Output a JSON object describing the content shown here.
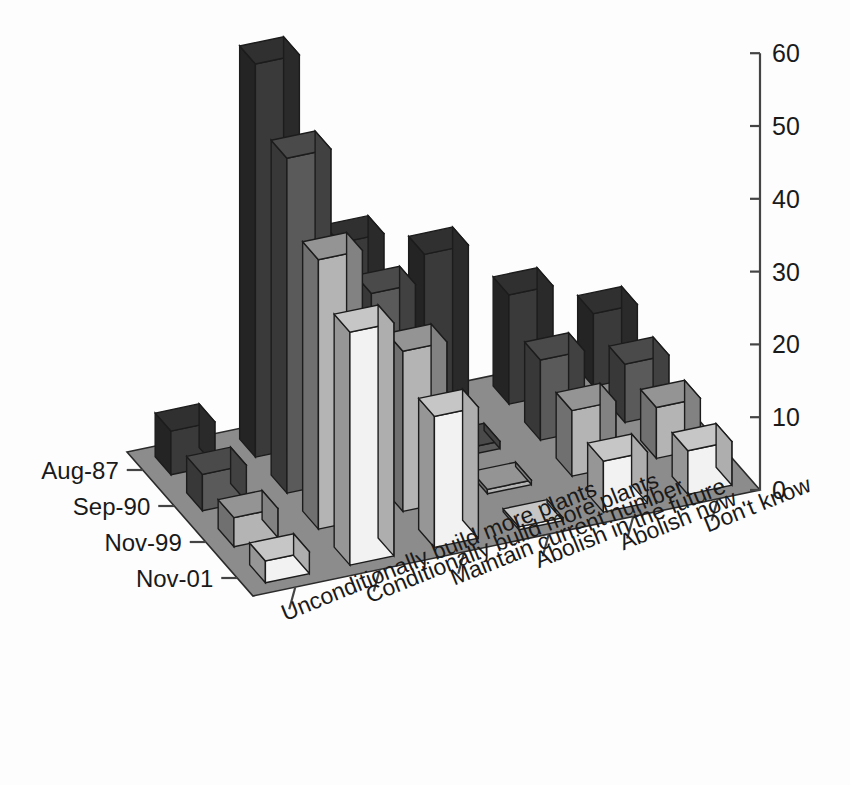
{
  "chart_data": {
    "type": "bar",
    "title": "",
    "subtitle": "",
    "xlabel": "",
    "ylabel": "",
    "zlabel": "",
    "projection": "3d-isometric",
    "grid": false,
    "legend_position": "none",
    "ylim": [
      0,
      60
    ],
    "ytick_labels": [
      "0",
      "10",
      "20",
      "30",
      "40",
      "50",
      "60"
    ],
    "ytick_values": [
      0,
      10,
      20,
      30,
      40,
      50,
      60
    ],
    "categories": [
      "Unconditionally build more plants",
      "Conditionally build more plants",
      "Maintain current number",
      "Abolish in the future",
      "Abolish now",
      "Don't know"
    ],
    "series": [
      {
        "name": "Aug-87",
        "color": "#3a3a3a",
        "values": [
          6,
          54,
          27,
          23,
          15,
          10
        ]
      },
      {
        "name": "Sep-90",
        "color": "#5a5a5a",
        "values": [
          5,
          46,
          25,
          1,
          11,
          8
        ]
      },
      {
        "name": "Nov-99",
        "color": "#b4b4b4",
        "values": [
          4,
          37,
          22,
          0.6,
          9,
          7
        ]
      },
      {
        "name": "Nov-01",
        "color": "#f2f2f2",
        "values": [
          3,
          32,
          18,
          0.4,
          7,
          6
        ]
      }
    ]
  },
  "axes": {
    "value_axis": {
      "min_label": "0",
      "max_label": "60",
      "step": "10"
    },
    "series_axis": {
      "labels": [
        "Aug-87",
        "Sep-90",
        "Nov-99",
        "Nov-01"
      ]
    },
    "category_axis": {
      "labels": [
        "Unconditionally build more plants",
        "Conditionally build more plants",
        "Maintain current number",
        "Abolish in the future",
        "Abolish now",
        "Don't know"
      ]
    }
  },
  "colors": {
    "floor": "#8c8c8c",
    "floor_edge": "#2b2b2b",
    "axis": "#444444",
    "text": "#1a1a1a",
    "background": "#fdfdfd"
  }
}
